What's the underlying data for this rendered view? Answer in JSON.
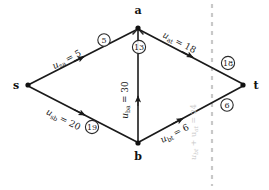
{
  "figure": {
    "type": "directed-flow-network-diagram",
    "background": "#ffffff",
    "ink_color": "#1a1a1a",
    "ghost_color": "#c9c9c9",
    "cut_line_color": "#c8c8c8"
  },
  "nodes": [
    {
      "id": "s",
      "label": "s",
      "x": 28,
      "y": 85,
      "label_x": 16,
      "label_y": 89
    },
    {
      "id": "a",
      "label": "a",
      "x": 138,
      "y": 28,
      "label_x": 138,
      "label_y": 14
    },
    {
      "id": "b",
      "label": "b",
      "x": 138,
      "y": 143,
      "label_x": 138,
      "label_y": 158
    },
    {
      "id": "t",
      "label": "t",
      "x": 243,
      "y": 85,
      "label_x": 256,
      "label_y": 89
    }
  ],
  "edges": [
    {
      "id": "sa",
      "from": "s",
      "to": "a",
      "label": "u",
      "sub": "sa",
      "eq": "= 5",
      "value": 5,
      "label_x": 68,
      "label_y": 62,
      "rotate": -27.4
    },
    {
      "id": "sb",
      "from": "s",
      "to": "b",
      "label": "u",
      "sub": "sb",
      "eq": "= 20",
      "value": 20,
      "label_x": 62,
      "label_y": 122,
      "rotate": 26.8
    },
    {
      "id": "ba",
      "from": "b",
      "to": "a",
      "label": "u",
      "sub": "ba",
      "eq": "= 30",
      "value": 30,
      "label_x": 130,
      "label_y": 98,
      "rotate": -90
    },
    {
      "id": "at",
      "from": "a",
      "to": "t",
      "label": "u",
      "sub": "at",
      "eq": "= 18",
      "value": 18,
      "label_x": 178,
      "label_y": 45,
      "rotate": 27.4
    },
    {
      "id": "bt",
      "from": "b",
      "to": "t",
      "label": "u",
      "sub": "bt",
      "eq": "= 6",
      "value": 6,
      "label_x": 178,
      "label_y": 134,
      "rotate": -26.8
    }
  ],
  "circled_numbers": [
    {
      "id": "c-sa",
      "value": "5",
      "x": 104,
      "y": 40
    },
    {
      "id": "c-ba",
      "value": "13",
      "x": 139,
      "y": 47
    },
    {
      "id": "c-at",
      "value": "18",
      "x": 228,
      "y": 63
    },
    {
      "id": "c-sb",
      "value": "19",
      "x": 92,
      "y": 127
    },
    {
      "id": "c-bt",
      "value": "6",
      "x": 227,
      "y": 105
    }
  ],
  "cut": {
    "line_x": 212,
    "line_y1": 4,
    "line_y2": 186,
    "annotation": "u",
    "annotation_sub1": "bt",
    "annotation_mid": " + u",
    "annotation_sub2": "at",
    "annotation_eq": " = 24",
    "annotation_value": 24,
    "annotation_x": 196,
    "annotation_y": 132
  }
}
